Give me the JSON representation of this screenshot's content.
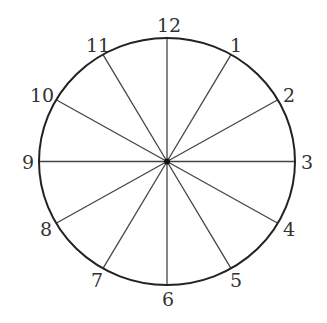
{
  "diagram": {
    "type": "clock-face",
    "center": {
      "x": 167,
      "y": 161.5
    },
    "radius_x": 128,
    "radius_y": 123.5,
    "stroke_color": "#222222",
    "spoke_color": "#444444",
    "label_color": "#333333",
    "labels": [
      {
        "text": "12",
        "x": 169,
        "y": 32
      },
      {
        "text": "1",
        "x": 236,
        "y": 52
      },
      {
        "text": "2",
        "x": 289,
        "y": 102
      },
      {
        "text": "3",
        "x": 307,
        "y": 169
      },
      {
        "text": "4",
        "x": 289,
        "y": 236
      },
      {
        "text": "5",
        "x": 236,
        "y": 287
      },
      {
        "text": "6",
        "x": 168,
        "y": 306
      },
      {
        "text": "7",
        "x": 97,
        "y": 287
      },
      {
        "text": "8",
        "x": 46,
        "y": 236
      },
      {
        "text": "9",
        "x": 28,
        "y": 169
      },
      {
        "text": "10",
        "x": 42,
        "y": 102
      },
      {
        "text": "11",
        "x": 98,
        "y": 52
      }
    ]
  }
}
